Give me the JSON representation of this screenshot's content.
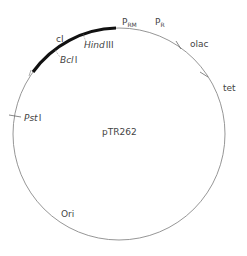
{
  "plasmid": {
    "name": "pTR262",
    "colors": {
      "backbone": "#8a8a8a",
      "insert": "#111111",
      "text": "#444444"
    }
  },
  "labels": {
    "cI": "cI",
    "hindIII_italic": "Hind",
    "hindIII_roman": "III",
    "bclI_italic": "Bcl",
    "bclI_roman": "I",
    "pstI_italic": "Pst",
    "pstI_roman": "I",
    "prm_main": "P",
    "prm_sub": "RM",
    "pr_main": "P",
    "pr_sub": "R",
    "olac": "olac",
    "tet": "tet",
    "ori": "Ori"
  }
}
